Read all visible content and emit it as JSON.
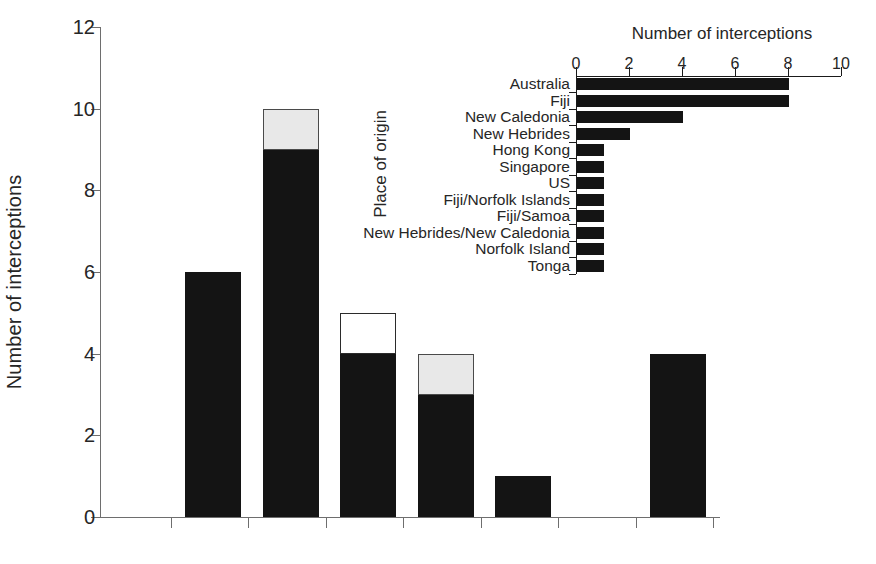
{
  "chart_data": [
    {
      "type": "bar",
      "name": "main-stacked-bar",
      "title": "",
      "xlabel": "",
      "ylabel": "Number of interceptions",
      "ylim": [
        0,
        12
      ],
      "ytick_labels": [
        "0",
        "2",
        "4",
        "6",
        "8",
        "10",
        "12"
      ],
      "ytick_values": [
        0,
        2,
        4,
        6,
        8,
        10,
        12
      ],
      "xtick_labels": [
        "",
        "",
        "",
        "",
        "",
        "",
        ""
      ],
      "grid": false,
      "legend": "none",
      "categories": [
        "1",
        "2",
        "3",
        "4",
        "5",
        "6",
        "7"
      ],
      "series": [
        {
          "name": "black",
          "color": "#141414",
          "values": [
            6,
            9,
            4,
            3,
            1,
            0,
            4
          ]
        },
        {
          "name": "white",
          "color": "#ffffff",
          "values": [
            0,
            0,
            1,
            0,
            0,
            0,
            0
          ]
        },
        {
          "name": "grey",
          "color": "#e8e8e8",
          "values": [
            0,
            1,
            0,
            1,
            0,
            0,
            0
          ]
        }
      ],
      "totals": [
        6,
        10,
        5,
        4,
        1,
        0,
        4
      ]
    },
    {
      "type": "bar",
      "name": "inset-horizontal-bar",
      "orientation": "horizontal",
      "title": "Number of interceptions",
      "xlabel": "Number of interceptions",
      "ylabel": "Place of origin",
      "xlim": [
        0,
        10
      ],
      "xtick_labels": [
        "0",
        "2",
        "4",
        "6",
        "8",
        "10"
      ],
      "xtick_values": [
        0,
        2,
        4,
        6,
        8,
        10
      ],
      "grid": false,
      "legend": "none",
      "axis_position": "top",
      "categories": [
        "Australia",
        "Fiji",
        "New Caledonia",
        "New Hebrides",
        "Hong Kong",
        "Singapore",
        "US",
        "Fiji/Norfolk Islands",
        "Fiji/Samoa",
        "New Hebrides/New Caledonia",
        "Norfolk Island",
        "Tonga"
      ],
      "values": [
        8,
        8,
        4,
        2,
        1,
        1,
        1,
        1,
        1,
        1,
        1,
        1
      ],
      "bar_color": "#141414"
    }
  ],
  "main": {
    "ylabel": "Number of interceptions",
    "yticks": [
      {
        "label": "12",
        "value": 12
      },
      {
        "label": "10",
        "value": 10
      },
      {
        "label": "8",
        "value": 8
      },
      {
        "label": "6",
        "value": 6
      },
      {
        "label": "4",
        "value": 4
      },
      {
        "label": "2",
        "value": 2
      },
      {
        "label": "0",
        "value": 0
      }
    ],
    "bars": [
      {
        "index": 0,
        "total": 6,
        "black": 6,
        "white": 0,
        "grey": 0
      },
      {
        "index": 1,
        "total": 10,
        "black": 9,
        "white": 0,
        "grey": 1
      },
      {
        "index": 2,
        "total": 5,
        "black": 4,
        "white": 1,
        "grey": 0
      },
      {
        "index": 3,
        "total": 4,
        "black": 3,
        "white": 0,
        "grey": 1
      },
      {
        "index": 4,
        "total": 1,
        "black": 1,
        "white": 0,
        "grey": 0
      },
      {
        "index": 5,
        "total": 0,
        "black": 0,
        "white": 0,
        "grey": 0
      },
      {
        "index": 6,
        "total": 4,
        "black": 4,
        "white": 0,
        "grey": 0
      }
    ]
  },
  "inset": {
    "title": "Number of interceptions",
    "ylabel": "Place of origin",
    "xticks": [
      {
        "label": "0",
        "value": 0
      },
      {
        "label": "2",
        "value": 2
      },
      {
        "label": "4",
        "value": 4
      },
      {
        "label": "6",
        "value": 6
      },
      {
        "label": "8",
        "value": 8
      },
      {
        "label": "10",
        "value": 10
      }
    ],
    "rows": [
      {
        "label": "Australia",
        "value": 8
      },
      {
        "label": "Fiji",
        "value": 8
      },
      {
        "label": "New Caledonia",
        "value": 4
      },
      {
        "label": "New Hebrides",
        "value": 2
      },
      {
        "label": "Hong Kong",
        "value": 1
      },
      {
        "label": "Singapore",
        "value": 1
      },
      {
        "label": "US",
        "value": 1
      },
      {
        "label": "Fiji/Norfolk Islands",
        "value": 1
      },
      {
        "label": "Fiji/Samoa",
        "value": 1
      },
      {
        "label": "New Hebrides/New Caledonia",
        "value": 1
      },
      {
        "label": "Norfolk Island",
        "value": 1
      },
      {
        "label": "Tonga",
        "value": 1
      }
    ]
  },
  "colors": {
    "black_segment": "#141414",
    "grey_segment": "#e8e8e8",
    "white_segment": "#ffffff",
    "axis": "#6e6e6e",
    "text": "#262626"
  }
}
